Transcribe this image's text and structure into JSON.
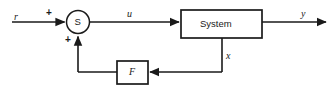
{
  "figure": {
    "kind": "block-diagram",
    "background_color": "#ffffff",
    "line_color": "#1a1a1a"
  },
  "blocks": {
    "summing_junction": {
      "label": "S",
      "shape": "circle",
      "name": "summing-junction"
    },
    "plant": {
      "label": "System",
      "shape": "rectangle",
      "name": "system-block"
    },
    "feedback": {
      "label": "F",
      "shape": "rectangle",
      "name": "feedback-gain-block"
    }
  },
  "signals": {
    "reference": "r",
    "control": "u",
    "output": "y",
    "state": "x"
  },
  "signs": {
    "reference_sign": "+",
    "feedback_sign": "+"
  }
}
